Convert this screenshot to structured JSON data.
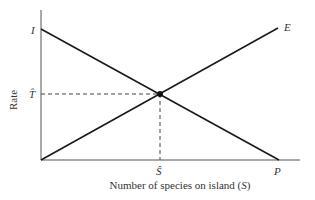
{
  "diagram": {
    "y_axis_label": "Rate",
    "x_axis_label_prefix": "Number of species on island (",
    "x_axis_label_var": "S",
    "x_axis_label_suffix": ")",
    "point_labels": {
      "immigration_intercept": "I",
      "extinction_end": "E",
      "pool_size": "P",
      "equilibrium_rate": "T",
      "equilibrium_species": "S"
    },
    "lines": [
      {
        "name": "immigration",
        "from": "I",
        "to": "P",
        "direction": "decreasing"
      },
      {
        "name": "extinction",
        "from": "origin",
        "to": "E",
        "direction": "increasing"
      }
    ],
    "equilibrium": {
      "rate_label": "T̂",
      "species_label": "Ŝ"
    },
    "colors": {
      "line": "#1a1a1a",
      "axis": "#555555",
      "text": "#333333"
    }
  }
}
